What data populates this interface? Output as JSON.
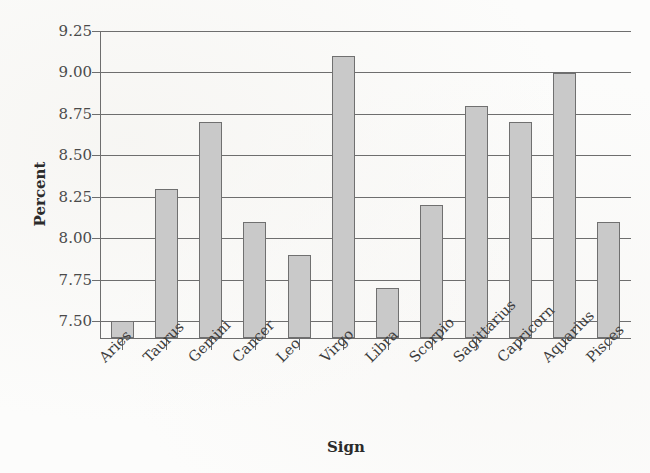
{
  "chart_data": {
    "type": "bar",
    "title": "",
    "subtitle": "",
    "xlabel": "Sign",
    "ylabel": "Percent",
    "categories": [
      "Aries",
      "Taurus",
      "Gemini",
      "Cancer",
      "Leo",
      "Virgo",
      "Libra",
      "Scorpio",
      "Sagittarius",
      "Capricorn",
      "Aquarius",
      "Pisces"
    ],
    "values": [
      7.5,
      8.3,
      8.7,
      8.1,
      7.9,
      9.1,
      7.7,
      8.2,
      8.8,
      8.7,
      9.0,
      8.1
    ],
    "ylim": [
      7.4,
      9.25
    ],
    "y_ticks": [
      "9.25",
      "9.00",
      "8.75",
      "8.50",
      "8.25",
      "8.00",
      "7.75",
      "7.50"
    ],
    "y_tick_values": [
      9.25,
      9.0,
      8.75,
      8.5,
      8.25,
      8.0,
      7.75,
      7.5
    ],
    "grid": "horizontal",
    "legend": "none",
    "series_name": "Percent",
    "bar_fill_color": "#c9c9c9",
    "bar_border_color": "#707070",
    "axis_color": "#6e6e6e",
    "background_color": "#fcfcfb"
  }
}
